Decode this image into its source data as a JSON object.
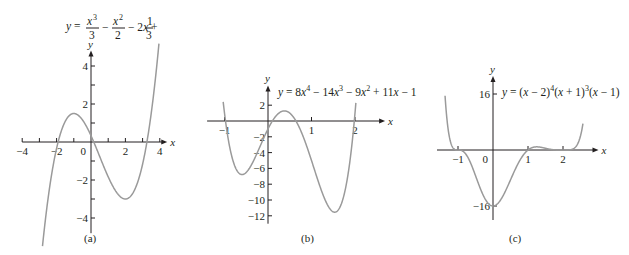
{
  "chart_data": [
    {
      "id": "a",
      "type": "line",
      "caption": "(a)",
      "title": "y = x^3/3 - x^2/2 - 2x + 1/3",
      "function": "x^3/3 - x^2/2 - 2*x + 1/3",
      "xlabel": "x",
      "ylabel": "y",
      "xlim": [
        -4,
        4.2
      ],
      "ylim": [
        -4.8,
        4.6
      ],
      "xticks": [
        -4,
        -3,
        -2,
        -1,
        1,
        2,
        3,
        4
      ],
      "xticklabels": [
        {
          "v": -4,
          "t": "−4"
        },
        {
          "v": -2,
          "t": "−2"
        },
        {
          "v": 2,
          "t": "2"
        },
        {
          "v": 4,
          "t": "4"
        }
      ],
      "yticks": [
        -4,
        -3,
        -2,
        -1,
        1,
        2,
        3,
        4
      ],
      "yticklabels": [
        {
          "v": 4,
          "t": "4"
        },
        {
          "v": 2,
          "t": "2"
        },
        {
          "v": -2,
          "t": "−2"
        },
        {
          "v": -4,
          "t": "−4"
        }
      ],
      "origin_label": "0",
      "domain": [
        -2.82,
        3.95
      ],
      "key_points": [
        {
          "x": -1,
          "y": 1.5,
          "note": "local max"
        },
        {
          "x": 2,
          "y": -3,
          "note": "local min"
        }
      ],
      "grid": false,
      "px": {
        "ox": 91,
        "oy": 142,
        "sx": 17.2,
        "sy": 19.0
      }
    },
    {
      "id": "b",
      "type": "line",
      "caption": "(b)",
      "title": "y = 8x^4 - 14x^3 - 9x^2 + 11x - 1",
      "function": "8*x^4 - 14*x^3 - 9*x^2 + 11*x - 1",
      "xlabel": "x",
      "ylabel": "y",
      "xlim": [
        -1.4,
        2.6
      ],
      "ylim": [
        -13,
        4
      ],
      "xticks": [
        -1,
        1,
        2
      ],
      "xticklabels": [
        {
          "v": -1,
          "t": "−1"
        },
        {
          "v": 1,
          "t": "1"
        },
        {
          "v": 2,
          "t": "2"
        }
      ],
      "yticks": [
        2,
        -2,
        -4,
        -6,
        -8,
        -10,
        -12
      ],
      "yticklabels": [
        {
          "v": 2,
          "t": "2"
        },
        {
          "v": -2,
          "t": "−2"
        },
        {
          "v": -4,
          "t": "−4"
        },
        {
          "v": -6,
          "t": "−6"
        },
        {
          "v": -8,
          "t": "−8"
        },
        {
          "v": -10,
          "t": "−10"
        },
        {
          "v": -12,
          "t": "−12"
        }
      ],
      "origin_label": "",
      "domain": [
        -1.03,
        2.02
      ],
      "key_points": [
        {
          "x": -0.6,
          "y": -6.8,
          "note": "local min"
        },
        {
          "x": 0.4,
          "y": 1.3,
          "note": "local max"
        },
        {
          "x": 1.6,
          "y": -11.3,
          "note": "local min"
        }
      ],
      "grid": false,
      "px": {
        "ox": 268,
        "oy": 121,
        "sx": 43.5,
        "sy": 7.9
      }
    },
    {
      "id": "c",
      "type": "line",
      "caption": "(c)",
      "title": "y = (x - 2)^4 (x + 1)^3 (x - 1)",
      "function": "(x-2)^4*(x+1)^3*(x-1)",
      "xlabel": "x",
      "ylabel": "y",
      "xlim": [
        -1.6,
        2.9
      ],
      "ylim": [
        -20,
        20
      ],
      "xticks": [
        -1,
        1,
        2
      ],
      "xticklabels": [
        {
          "v": -1,
          "t": "−1"
        },
        {
          "v": 1,
          "t": "1"
        },
        {
          "v": 2,
          "t": "2"
        }
      ],
      "yticks": [
        16,
        -16
      ],
      "yticklabels": [
        {
          "v": 16,
          "t": "16"
        },
        {
          "v": -16,
          "t": "−16"
        }
      ],
      "origin_label": "0",
      "domain": [
        -1.37,
        2.57
      ],
      "key_points": [
        {
          "x": 0,
          "y": -16,
          "note": "local min"
        },
        {
          "x": 1.25,
          "y": 0.9,
          "note": "local max"
        }
      ],
      "grid": false,
      "px": {
        "ox": 493,
        "oy": 150,
        "sx": 35.0,
        "sy": 3.5
      }
    }
  ]
}
